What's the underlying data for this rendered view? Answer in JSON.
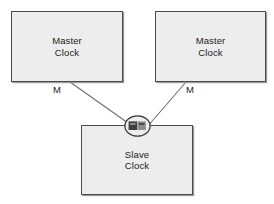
{
  "diagram": {
    "background_color": "#ffffff",
    "node_fill_color": "#ededed",
    "node_border_color": "#4a4a4a",
    "line_color": "#6e6e6e",
    "text_color": "#1c1c1c"
  },
  "nodes": {
    "master_left": {
      "line1": "Master",
      "line2": "Clock"
    },
    "master_right": {
      "line1": "Master",
      "line2": "Clock"
    },
    "slave": {
      "line1": "Slave",
      "line2": "Clock"
    }
  },
  "edges": [
    {
      "id": "left-link",
      "label": "M",
      "from": "master_left",
      "to": "slave",
      "x1": 70,
      "y1": 82,
      "x2": 128,
      "y2": 123
    },
    {
      "id": "right-link",
      "label": "M",
      "from": "master_right",
      "to": "slave",
      "x1": 186,
      "y1": 82,
      "x2": 147,
      "y2": 127
    }
  ],
  "junction": {
    "icon": "clock-selector-icon",
    "cx": 137.5,
    "cy": 126,
    "rx": 13,
    "ry": 10.5,
    "block_color": "#3c3c3c",
    "block_color_light": "#8e8e8e"
  }
}
